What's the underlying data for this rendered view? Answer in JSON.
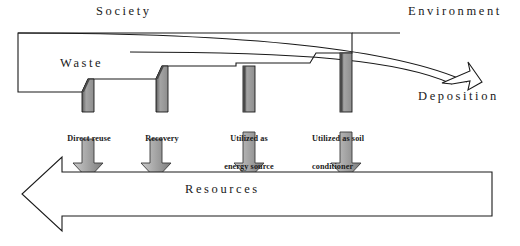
{
  "diagram": {
    "title_labels": {
      "society": "Society",
      "environment": "Environment",
      "deposition": "Deposition",
      "waste": "Waste",
      "resources": "Resources"
    },
    "stream_labels": [
      {
        "id": "direct-reuse",
        "line1": "Direct reuse",
        "line2": ""
      },
      {
        "id": "recovery",
        "line1": "Recovery",
        "line2": ""
      },
      {
        "id": "energy-source",
        "line1": "Utilized as",
        "line2": "energy source"
      },
      {
        "id": "soil-conditioner",
        "line1": "Utilized as soil",
        "line2": "conditioner"
      }
    ],
    "colors": {
      "stroke": "#1a1a1a",
      "bar_fill": "#9a9a9a",
      "bar_bevel": "#4a4a4a",
      "arrow_fill": "#a6a6a6",
      "arrow_shadow": "#6d6d6d",
      "background": "#ffffff"
    }
  }
}
